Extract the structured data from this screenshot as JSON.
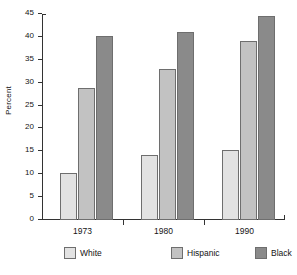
{
  "chart_data": {
    "type": "bar",
    "title": "",
    "subtitle": "",
    "xlabel": "",
    "ylabel": "Percent",
    "categories": [
      "1973",
      "1980",
      "1990"
    ],
    "series": [
      {
        "name": "White",
        "color": "#e2e2e2",
        "values": [
          10.3,
          14.1,
          15.4
        ]
      },
      {
        "name": "Hispanic",
        "color": "#c2c2c2",
        "values": [
          28.8,
          32.9,
          39.0
        ]
      },
      {
        "name": "Black",
        "color": "#8a8a8a",
        "values": [
          40.2,
          41.0,
          44.5
        ]
      }
    ],
    "ylim": [
      0,
      45
    ],
    "ytick_labels": [
      "0",
      "5",
      "10",
      "15",
      "20",
      "25",
      "30",
      "35",
      "40",
      "45"
    ],
    "ytick_values": [
      0,
      5,
      10,
      15,
      20,
      25,
      30,
      35,
      40,
      45
    ],
    "grid": false,
    "legend_position": "bottom",
    "bar_edge_color": "#6e6e6e",
    "axis_color": "#333333"
  }
}
